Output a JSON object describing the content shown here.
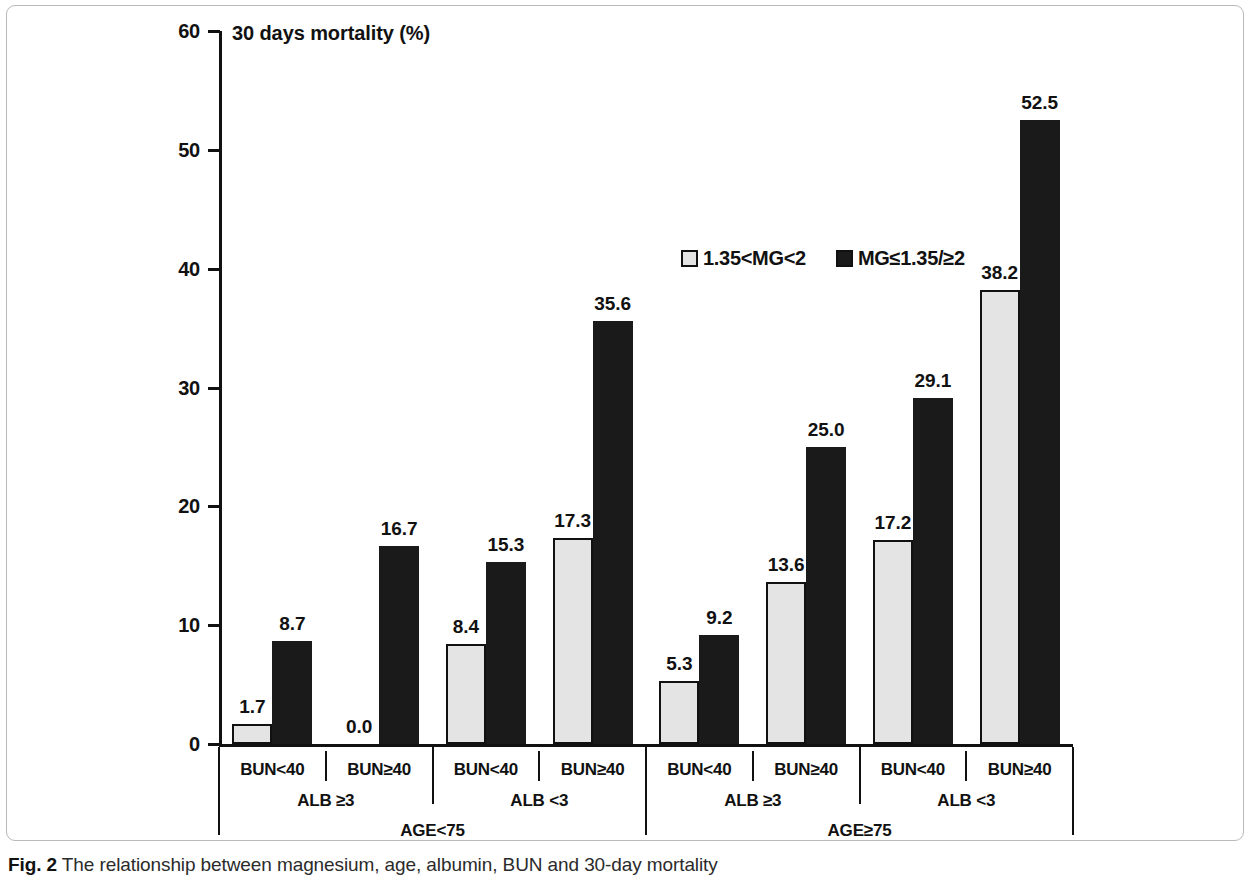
{
  "caption": {
    "prefix": "Fig. 2",
    "text": " The relationship between magnesium, age, albumin, BUN and 30-day mortality"
  },
  "colors": {
    "light_series": "#e4e4e4",
    "dark_series": "#1a1a1a",
    "axis": "#111111",
    "frame": "#b9b9b9"
  },
  "chart_data": {
    "type": "bar",
    "title": "30 days mortality (%)",
    "xlabel": "",
    "ylabel": "30 days mortality (%)",
    "ylim": [
      0,
      60
    ],
    "yticks": [
      0,
      10,
      20,
      30,
      40,
      50,
      60
    ],
    "ytick_labels": [
      "0",
      "10",
      "20",
      "30",
      "40",
      "50",
      "60"
    ],
    "grid": false,
    "legend_position": "upper-center-right",
    "categories": [
      "BUN<40",
      "BUN≥40",
      "BUN<40",
      "BUN≥40",
      "BUN<40",
      "BUN≥40",
      "BUN<40",
      "BUN≥40"
    ],
    "group_tier2": [
      "ALB ≥3",
      "ALB <3",
      "ALB ≥3",
      "ALB <3"
    ],
    "group_tier3": [
      "AGE<75",
      "AGE≥75"
    ],
    "series": [
      {
        "name": "1.35<MG<2",
        "style": "light",
        "values": [
          1.7,
          0.0,
          8.4,
          17.3,
          5.3,
          13.6,
          17.2,
          38.2
        ],
        "labels": [
          "1.7",
          "0.0",
          "8.4",
          "17.3",
          "5.3",
          "13.6",
          "17.2",
          "38.2"
        ]
      },
      {
        "name": "MG≤1.35/≥2",
        "style": "dark",
        "values": [
          8.7,
          16.7,
          15.3,
          35.6,
          9.2,
          25.0,
          29.1,
          52.5
        ],
        "labels": [
          "8.7",
          "16.7",
          "15.3",
          "35.6",
          "9.2",
          "25.0",
          "29.1",
          "52.5"
        ]
      }
    ]
  }
}
